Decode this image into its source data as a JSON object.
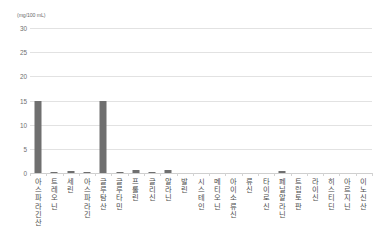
{
  "chart_data": {
    "type": "bar",
    "title": "",
    "subtitle": "",
    "xlabel": "",
    "ylabel": "(mg/100 mL)",
    "unit_caption": "(mg/100 mL)",
    "ylim": [
      0,
      30
    ],
    "yticks": [
      30,
      25,
      20,
      15,
      10,
      5,
      0
    ],
    "ytick_labels": [
      "30",
      "25",
      "20",
      "15",
      "10",
      "5",
      "0"
    ],
    "grid": true,
    "legend": "none",
    "bar_color": "#6f6f6f",
    "grid_color": "#e2e2e2",
    "axis_color": "#cfcfcf",
    "categories": [
      "아스파라긴산",
      "트레오닌",
      "세린",
      "아스파라긴",
      "글루탐산",
      "글루타민",
      "프롤린",
      "글리신",
      "알라닌",
      "발린",
      "시스테인",
      "메티오닌",
      "아이소류신",
      "류신",
      "타이로신",
      "페닐알라닌",
      "트립토판",
      "라이신",
      "히스티딘",
      "아르지닌",
      "이노신산"
    ],
    "values": [
      15.0,
      0.1,
      0.4,
      0.05,
      15.0,
      0.05,
      0.7,
      0.05,
      0.7,
      0.0,
      0.0,
      0.0,
      0.0,
      0.0,
      0.0,
      0.5,
      0.0,
      0.0,
      0.0,
      0.0,
      0.0
    ]
  }
}
